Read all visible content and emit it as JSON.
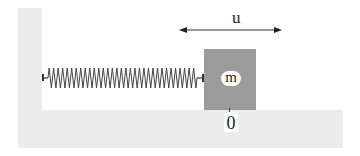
{
  "diagram": {
    "type": "spring-mass-system",
    "title": "",
    "labels": {
      "displacement": "u",
      "mass": "m",
      "origin": "0"
    },
    "components": [
      {
        "id": "wall",
        "kind": "fixed-wall"
      },
      {
        "id": "floor",
        "kind": "ground"
      },
      {
        "id": "spring",
        "kind": "spring",
        "connects": [
          "wall",
          "block"
        ],
        "coils": 33
      },
      {
        "id": "block",
        "kind": "mass",
        "label": "m"
      },
      {
        "id": "displacement-arrow",
        "kind": "double-headed-arrow",
        "label": "u"
      },
      {
        "id": "origin-marker",
        "kind": "tick",
        "label": "0"
      }
    ],
    "colors": {
      "wall": "#ececec",
      "floor": "#ececec",
      "block": "#9b9b9b",
      "spring": "#444444",
      "arrow": "#222222"
    }
  }
}
